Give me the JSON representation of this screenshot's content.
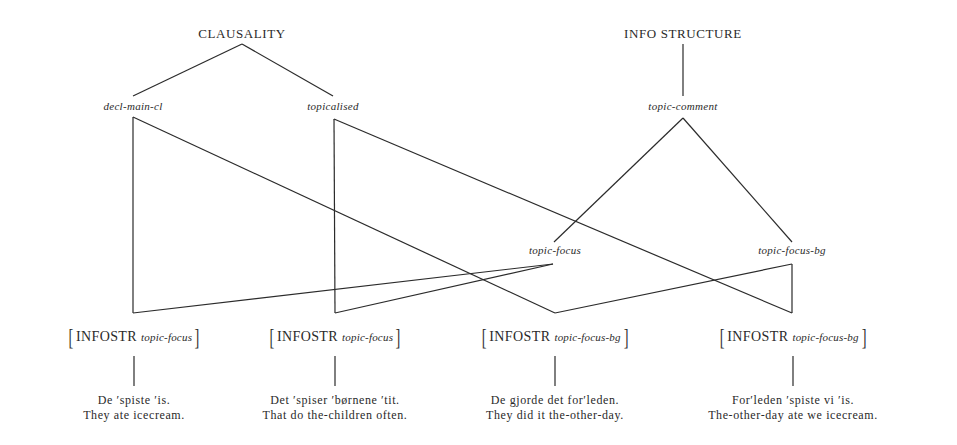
{
  "diagram": {
    "roots": [
      {
        "id": "clausality",
        "label": "CLAUSALITY"
      },
      {
        "id": "info_structure",
        "label": "INFO STRUCTURE"
      }
    ],
    "subtypes": {
      "decl_main_cl": "decl-main-cl",
      "topicalised": "topicalised",
      "topic_comment": "topic-comment",
      "topic_focus": "topic-focus",
      "topic_focus_bg": "topic-focus-bg"
    },
    "leaves": [
      {
        "attr": "INFOSTR",
        "value": "topic-focus",
        "example": "De ʹspiste ʹis.",
        "gloss": "They ate icecream.",
        "parents": [
          "decl-main-cl",
          "topic-focus"
        ]
      },
      {
        "attr": "INFOSTR",
        "value": "topic-focus",
        "example": "Det ʹspiser ʹbørnene ʹtit.",
        "gloss": "That do the-children often.",
        "parents": [
          "topicalised",
          "topic-focus"
        ]
      },
      {
        "attr": "INFOSTR",
        "value": "topic-focus-bg",
        "example": "De gjorde det forʹleden.",
        "gloss": "They did it the-other-day.",
        "parents": [
          "decl-main-cl",
          "topic-focus-bg"
        ]
      },
      {
        "attr": "INFOSTR",
        "value": "topic-focus-bg",
        "example": "Forʹleden ʹspiste vi ʹis.",
        "gloss": "The-other-day ate we icecream.",
        "parents": [
          "topicalised",
          "topic-focus-bg"
        ]
      }
    ]
  }
}
